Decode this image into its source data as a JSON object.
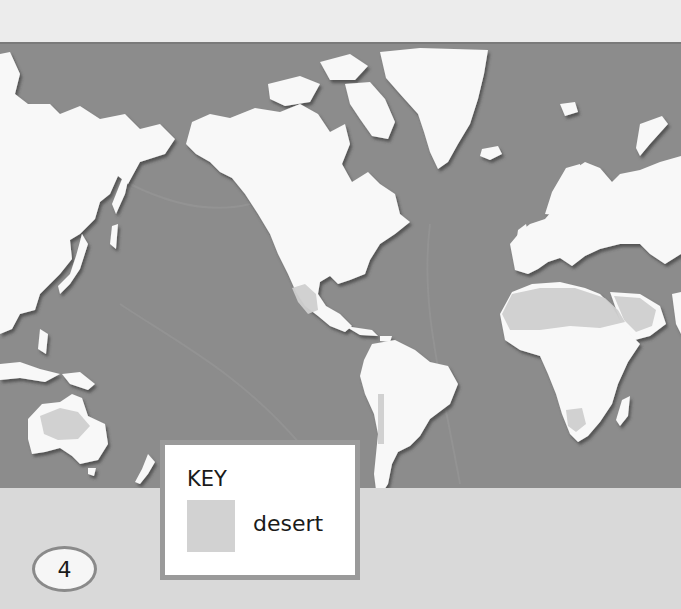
{
  "page": {
    "page_number": "4"
  },
  "map": {
    "projection_style": "world map, Pacific-centered (Americas center)",
    "colors": {
      "header": "#ececec",
      "ocean": "#8c8c8c",
      "land": "#f8f8f8",
      "desert": "#cfcfcf",
      "bottom_strip": "#d9d9d9",
      "key_border": "#9a9a9a"
    },
    "regions": [
      {
        "name": "Asia (east)",
        "type": "land"
      },
      {
        "name": "North America",
        "type": "land"
      },
      {
        "name": "Greenland",
        "type": "land"
      },
      {
        "name": "South America",
        "type": "land"
      },
      {
        "name": "Europe",
        "type": "land"
      },
      {
        "name": "Africa",
        "type": "land"
      },
      {
        "name": "Australia",
        "type": "land"
      },
      {
        "name": "New Zealand",
        "type": "land"
      },
      {
        "name": "Sahara",
        "type": "desert"
      },
      {
        "name": "Arabian",
        "type": "desert"
      },
      {
        "name": "North American",
        "type": "desert"
      },
      {
        "name": "Australian",
        "type": "desert"
      },
      {
        "name": "Kalahari",
        "type": "desert"
      },
      {
        "name": "Atacama / Patagonia",
        "type": "desert"
      }
    ]
  },
  "key": {
    "title": "KEY",
    "items": [
      {
        "label": "desert",
        "color": "#d2d2d2"
      }
    ]
  }
}
